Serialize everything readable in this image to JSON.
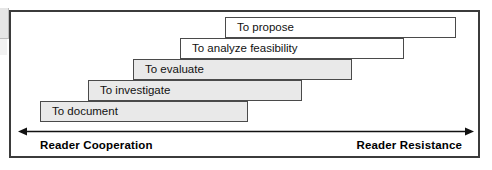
{
  "figure": {
    "frame_color": "#3b3b3b",
    "box_border_color": "#4a4a4a",
    "box_fill_shaded": "#e9e9e9",
    "box_fill_plain": "#ffffff",
    "background": "#ffffff"
  },
  "steps": [
    {
      "label": "To document",
      "fill": "shaded",
      "x": 40,
      "y": 101,
      "width": 208,
      "height": 21
    },
    {
      "label": "To investigate",
      "fill": "shaded",
      "x": 88,
      "y": 80,
      "width": 214,
      "height": 21
    },
    {
      "label": "To evaluate",
      "fill": "shaded",
      "x": 133,
      "y": 59,
      "width": 219,
      "height": 21
    },
    {
      "label": "To analyze feasibility",
      "fill": "plain",
      "x": 180,
      "y": 38,
      "width": 224,
      "height": 21
    },
    {
      "label": "To propose",
      "fill": "plain",
      "x": 225,
      "y": 17,
      "width": 231,
      "height": 21
    }
  ],
  "axis": {
    "left_label": "Reader Cooperation",
    "right_label": "Reader Resistance",
    "arrow_style": "double-headed",
    "line_color": "#111111"
  }
}
